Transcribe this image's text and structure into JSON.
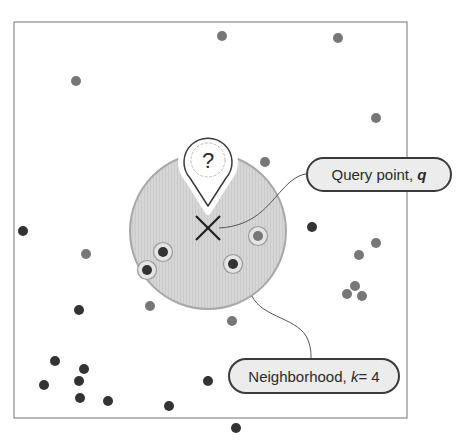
{
  "diagram": {
    "colors": {
      "frame": "#8a8a8a",
      "neighborhood_fill": "#d4d4d4",
      "neighborhood_stroke": "#a8a8a8",
      "point_dark": "#333333",
      "point_gray": "#777777",
      "ring": "#9a9a9a",
      "label_fill": "#ececec",
      "label_stroke": "#3a3a3a",
      "connector": "#555555",
      "query_marker": "#1e1e1e"
    },
    "frame": {
      "x": 14,
      "y": 22,
      "width": 393,
      "height": 396
    },
    "neighborhood": {
      "cx": 208,
      "cy": 231,
      "r": 78,
      "k": 4
    },
    "query_point": {
      "x": 208,
      "y": 228,
      "marker": "x-mark",
      "pin_glyph": "?"
    },
    "pin": {
      "cx": 208,
      "cy": 160,
      "icon": "map-pin-question-icon"
    },
    "labels": {
      "query": {
        "text": "Query point, ",
        "var": "q"
      },
      "neighborhood": {
        "text": "Neighborhood, ",
        "var": "k",
        "suffix": " = 4"
      }
    },
    "points_gray": [
      [
        222,
        36
      ],
      [
        338,
        38
      ],
      [
        76,
        81
      ],
      [
        376,
        118
      ],
      [
        265,
        162
      ],
      [
        86,
        254
      ],
      [
        359,
        255
      ],
      [
        376,
        243
      ],
      [
        150,
        306
      ],
      [
        232,
        321
      ],
      [
        355,
        286
      ],
      [
        347,
        294
      ],
      [
        362,
        296
      ]
    ],
    "points_dark": [
      [
        23,
        231
      ],
      [
        312,
        227
      ],
      [
        79,
        310
      ],
      [
        55,
        361
      ],
      [
        84,
        369
      ],
      [
        79,
        381
      ],
      [
        44,
        385
      ],
      [
        80,
        398
      ],
      [
        108,
        401
      ],
      [
        169,
        406
      ],
      [
        208,
        381
      ],
      [
        236,
        428
      ]
    ],
    "neighbors": [
      {
        "x": 163,
        "y": 252,
        "tone": "dark"
      },
      {
        "x": 147,
        "y": 270,
        "tone": "dark"
      },
      {
        "x": 233,
        "y": 264,
        "tone": "dark"
      },
      {
        "x": 258,
        "y": 236,
        "tone": "gray"
      }
    ]
  }
}
